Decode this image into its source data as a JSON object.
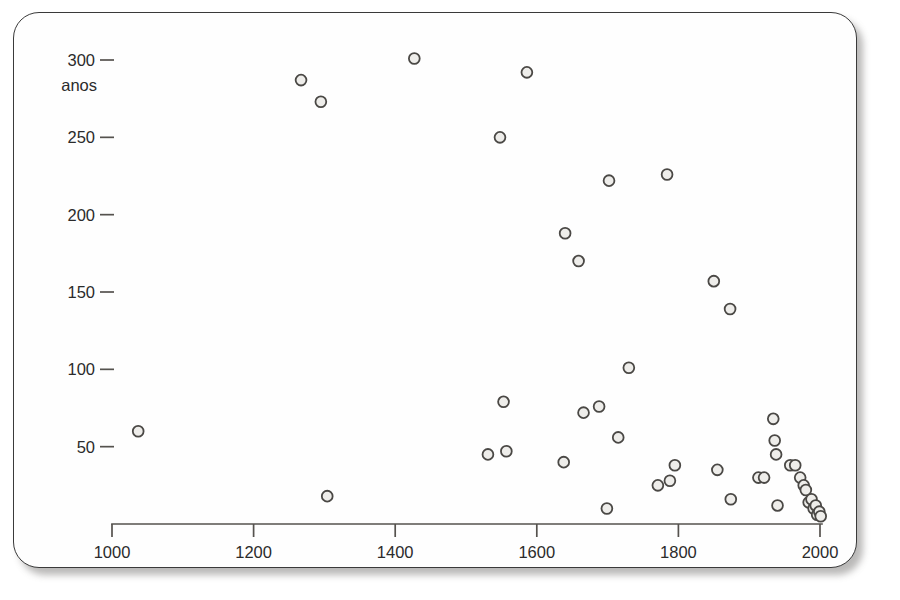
{
  "figure": {
    "unit_label": "anos",
    "background_color": "#fefefe",
    "frame_color": "#3a3a3a",
    "point_fill": "#eeedea",
    "point_stroke": "#4a4845",
    "axis_color": "#55524e"
  },
  "chart_data": {
    "type": "scatter",
    "title": "",
    "subtitle": "",
    "xlabel": "",
    "ylabel": "anos",
    "xlim": [
      1000,
      2030
    ],
    "ylim": [
      0,
      310
    ],
    "grid": false,
    "legend": null,
    "x_ticks": [
      1000,
      1200,
      1400,
      1600,
      1800,
      2000
    ],
    "x_tick_labels": [
      "1000",
      "1200",
      "1400",
      "1600",
      "1800",
      "2000"
    ],
    "y_ticks": [
      50,
      100,
      150,
      200,
      250,
      300
    ],
    "y_tick_labels": [
      "50",
      "100",
      "150",
      "200",
      "250",
      "300"
    ],
    "marker": "open-circle",
    "n_points": 45,
    "points": [
      {
        "x": 1037,
        "y": 60
      },
      {
        "x": 1267,
        "y": 287
      },
      {
        "x": 1295,
        "y": 273
      },
      {
        "x": 1304,
        "y": 18
      },
      {
        "x": 1427,
        "y": 301
      },
      {
        "x": 1531,
        "y": 45
      },
      {
        "x": 1548,
        "y": 250
      },
      {
        "x": 1553,
        "y": 79
      },
      {
        "x": 1557,
        "y": 47
      },
      {
        "x": 1586,
        "y": 292
      },
      {
        "x": 1638,
        "y": 40
      },
      {
        "x": 1640,
        "y": 188
      },
      {
        "x": 1659,
        "y": 170
      },
      {
        "x": 1666,
        "y": 72
      },
      {
        "x": 1688,
        "y": 76
      },
      {
        "x": 1699,
        "y": 10
      },
      {
        "x": 1702,
        "y": 222
      },
      {
        "x": 1715,
        "y": 56
      },
      {
        "x": 1730,
        "y": 101
      },
      {
        "x": 1771,
        "y": 25
      },
      {
        "x": 1784,
        "y": 226
      },
      {
        "x": 1788,
        "y": 28
      },
      {
        "x": 1795,
        "y": 38
      },
      {
        "x": 1850,
        "y": 157
      },
      {
        "x": 1855,
        "y": 35
      },
      {
        "x": 1873,
        "y": 139
      },
      {
        "x": 1874,
        "y": 16
      },
      {
        "x": 1913,
        "y": 30
      },
      {
        "x": 1921,
        "y": 30
      },
      {
        "x": 1934,
        "y": 68
      },
      {
        "x": 1936,
        "y": 54
      },
      {
        "x": 1938,
        "y": 45
      },
      {
        "x": 1940,
        "y": 12
      },
      {
        "x": 1958,
        "y": 38
      },
      {
        "x": 1965,
        "y": 38
      },
      {
        "x": 1972,
        "y": 30
      },
      {
        "x": 1977,
        "y": 25
      },
      {
        "x": 1980,
        "y": 22
      },
      {
        "x": 1984,
        "y": 14
      },
      {
        "x": 1988,
        "y": 16
      },
      {
        "x": 1991,
        "y": 10
      },
      {
        "x": 1994,
        "y": 12
      },
      {
        "x": 1996,
        "y": 6
      },
      {
        "x": 1999,
        "y": 8
      },
      {
        "x": 2001,
        "y": 5
      }
    ]
  }
}
